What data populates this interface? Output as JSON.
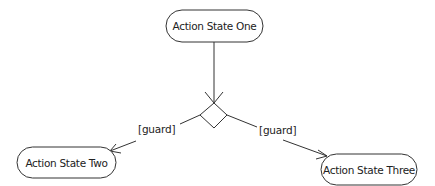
{
  "diagram": {
    "type": "UML activity diagram",
    "colors": {
      "background": "#ffffff",
      "stroke": "#333333",
      "text": "#222222"
    },
    "nodes": [
      {
        "id": "action-state-one",
        "kind": "action-state",
        "label": "Action State One"
      },
      {
        "id": "decision",
        "kind": "decision",
        "label": ""
      },
      {
        "id": "action-state-two",
        "kind": "action-state",
        "label": "Action State Two"
      },
      {
        "id": "action-state-three",
        "kind": "action-state",
        "label": "Action State Three"
      }
    ],
    "edges": [
      {
        "from": "action-state-one",
        "to": "decision",
        "label": ""
      },
      {
        "from": "decision",
        "to": "action-state-two",
        "label": "[guard]"
      },
      {
        "from": "decision",
        "to": "action-state-three",
        "label": "[guard]"
      }
    ]
  }
}
